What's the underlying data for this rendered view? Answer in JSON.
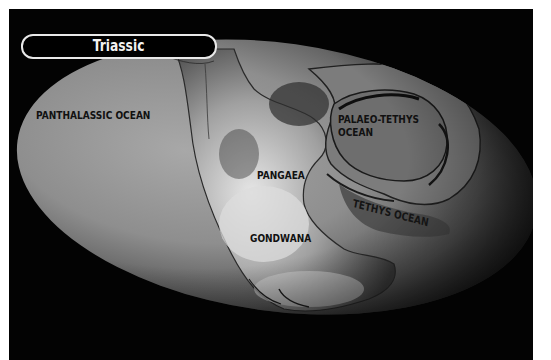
{
  "title": "Triassic",
  "map": {
    "labels": {
      "panthalassic": "PANTHALASSIC OCEAN",
      "palaeo_tethys_line1": "PALAEO-TETHYS",
      "palaeo_tethys_line2": "OCEAN",
      "pangaea": "PANGAEA",
      "tethys": "TETHYS OCEAN",
      "gondwana": "GONDWANA"
    }
  },
  "colors": {
    "background": "#030303",
    "pill_border": "#e8e8e8",
    "label_text": "#111111",
    "title_text": "#f2f2f2"
  }
}
